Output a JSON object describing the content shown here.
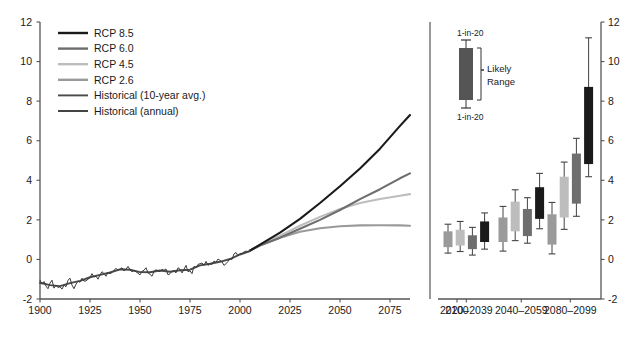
{
  "figure": {
    "title": "",
    "panels": [
      "projection-timeseries",
      "scenario-box-plots"
    ]
  },
  "colors": {
    "rcp85": "#1a1a1a",
    "rcp60": "#6e6e6e",
    "rcp45": "#bdbdbd",
    "rcp26": "#9a9a9a",
    "historical_10yr": "#4a4a4a",
    "historical_annual": "#3a3a3a",
    "axis": "#555555",
    "text": "#1a1a1a",
    "inset_box": "#555555"
  },
  "left_panel": {
    "y_ticks": [
      "12",
      "10",
      "8",
      "6",
      "4",
      "2",
      "0",
      "-2"
    ],
    "x_ticks": [
      "1900",
      "1925",
      "1950",
      "1975",
      "2000",
      "2025",
      "2050",
      "2075"
    ],
    "legend": [
      {
        "label": "RCP 8.5",
        "color_key": "rcp85"
      },
      {
        "label": "RCP 6.0",
        "color_key": "rcp60"
      },
      {
        "label": "RCP 4.5",
        "color_key": "rcp45"
      },
      {
        "label": "RCP 2.6",
        "color_key": "rcp26"
      },
      {
        "label": "Historical (10-year avg.)",
        "color_key": "historical_10yr"
      },
      {
        "label": "Historical (annual)",
        "color_key": "historical_annual"
      }
    ]
  },
  "right_panel": {
    "y_ticks": [
      "12",
      "10",
      "8",
      "6",
      "4",
      "2",
      "0",
      "-2"
    ],
    "x_ticks": [
      "2100",
      "2020–2039",
      "2040–2059",
      "2080–2099"
    ],
    "inset": {
      "upper_label": "1-in-20",
      "lower_label": "1-in-20",
      "bracket_label_line1": "Likely",
      "bracket_label_line2": "Range"
    }
  },
  "chart_data": {
    "type": "line",
    "title": "",
    "xlabel": "",
    "ylabel": "",
    "xlim": [
      1900,
      2085
    ],
    "ylim": [
      -2,
      12
    ],
    "grid": false,
    "legend_position": "upper-left",
    "x_ticks": [
      1900,
      1925,
      1950,
      1975,
      2000,
      2025,
      2050,
      2075
    ],
    "y_ticks": [
      -2,
      0,
      2,
      4,
      6,
      8,
      10,
      12
    ],
    "series": [
      {
        "name": "Historical (annual)",
        "color_key": "historical_annual",
        "x": [
          1900,
          1901,
          1902,
          1903,
          1904,
          1905,
          1906,
          1907,
          1908,
          1909,
          1910,
          1911,
          1912,
          1913,
          1914,
          1915,
          1916,
          1917,
          1918,
          1919,
          1920,
          1921,
          1922,
          1923,
          1924,
          1925,
          1926,
          1927,
          1928,
          1929,
          1930,
          1931,
          1932,
          1933,
          1934,
          1935,
          1936,
          1937,
          1938,
          1939,
          1940,
          1941,
          1942,
          1943,
          1944,
          1945,
          1946,
          1947,
          1948,
          1949,
          1950,
          1951,
          1952,
          1953,
          1954,
          1955,
          1956,
          1957,
          1958,
          1959,
          1960,
          1961,
          1962,
          1963,
          1964,
          1965,
          1966,
          1967,
          1968,
          1969,
          1970,
          1971,
          1972,
          1973,
          1974,
          1975,
          1976,
          1977,
          1978,
          1979,
          1980,
          1981,
          1982,
          1983,
          1984,
          1985,
          1986,
          1987,
          1988,
          1989,
          1990,
          1991,
          1992,
          1993,
          1994,
          1995,
          1996,
          1997,
          1998,
          1999,
          2000,
          2001,
          2002,
          2003,
          2004,
          2005
        ],
        "values": [
          -1.05,
          -1.25,
          -1.12,
          -1.35,
          -1.48,
          -1.2,
          -1.05,
          -1.45,
          -1.3,
          -1.42,
          -1.38,
          -1.5,
          -1.3,
          -1.38,
          -1.05,
          -0.95,
          -1.3,
          -1.48,
          -1.25,
          -1.1,
          -1.15,
          -0.95,
          -1.1,
          -1.08,
          -1.0,
          -0.92,
          -0.72,
          -0.88,
          -0.85,
          -1.0,
          -0.78,
          -0.62,
          -0.72,
          -0.85,
          -0.65,
          -0.72,
          -0.66,
          -0.55,
          -0.45,
          -0.55,
          -0.5,
          -0.42,
          -0.58,
          -0.5,
          -0.35,
          -0.52,
          -0.62,
          -0.55,
          -0.62,
          -0.7,
          -0.78,
          -0.6,
          -0.55,
          -0.42,
          -0.68,
          -0.75,
          -0.85,
          -0.6,
          -0.52,
          -0.58,
          -0.62,
          -0.5,
          -0.55,
          -0.48,
          -0.78,
          -0.72,
          -0.6,
          -0.58,
          -0.68,
          -0.42,
          -0.5,
          -0.68,
          -0.5,
          -0.3,
          -0.62,
          -0.58,
          -0.72,
          -0.35,
          -0.42,
          -0.25,
          -0.22,
          -0.18,
          -0.3,
          -0.1,
          -0.3,
          -0.22,
          -0.25,
          -0.08,
          -0.15,
          0.02,
          -0.05,
          -0.12,
          -0.3,
          -0.22,
          -0.1,
          0.05,
          0.0,
          0.28,
          0.35,
          0.18,
          0.3,
          0.3,
          0.38,
          0.42,
          0.4,
          0.45
        ]
      },
      {
        "name": "Historical (10-year avg.)",
        "color_key": "historical_10yr",
        "x": [
          1900,
          1905,
          1910,
          1915,
          1920,
          1925,
          1930,
          1935,
          1940,
          1945,
          1950,
          1955,
          1960,
          1965,
          1970,
          1975,
          1980,
          1985,
          1990,
          1995,
          2000,
          2005
        ],
        "values": [
          -1.18,
          -1.3,
          -1.35,
          -1.2,
          -1.08,
          -0.9,
          -0.78,
          -0.66,
          -0.5,
          -0.52,
          -0.64,
          -0.65,
          -0.56,
          -0.62,
          -0.55,
          -0.52,
          -0.3,
          -0.22,
          -0.12,
          0.02,
          0.25,
          0.42
        ]
      },
      {
        "name": "RCP 8.5",
        "color_key": "rcp85",
        "x": [
          2005,
          2010,
          2020,
          2030,
          2040,
          2050,
          2060,
          2070,
          2080,
          2085
        ],
        "values": [
          0.45,
          0.75,
          1.35,
          2.05,
          2.85,
          3.7,
          4.6,
          5.6,
          6.75,
          7.3
        ]
      },
      {
        "name": "RCP 6.0",
        "color_key": "rcp60",
        "x": [
          2005,
          2010,
          2020,
          2030,
          2040,
          2050,
          2060,
          2070,
          2080,
          2085
        ],
        "values": [
          0.45,
          0.7,
          1.1,
          1.55,
          2.0,
          2.5,
          3.05,
          3.55,
          4.1,
          4.35
        ]
      },
      {
        "name": "RCP 4.5",
        "color_key": "rcp45",
        "x": [
          2005,
          2010,
          2020,
          2030,
          2040,
          2050,
          2060,
          2070,
          2080,
          2085
        ],
        "values": [
          0.45,
          0.72,
          1.2,
          1.7,
          2.15,
          2.55,
          2.85,
          3.05,
          3.22,
          3.3
        ]
      },
      {
        "name": "RCP 2.6",
        "color_key": "rcp26",
        "x": [
          2005,
          2010,
          2020,
          2030,
          2040,
          2050,
          2060,
          2070,
          2080,
          2085
        ],
        "values": [
          0.45,
          0.72,
          1.1,
          1.4,
          1.58,
          1.68,
          1.72,
          1.73,
          1.72,
          1.7
        ]
      }
    ],
    "box_plots": {
      "type": "box",
      "ylim": [
        -2,
        12
      ],
      "groups": [
        {
          "label": "2020–2039",
          "boxes": [
            {
              "scenario": "RCP 2.6",
              "color_key": "rcp26",
              "low": 0.62,
              "high": 1.42,
              "whisker_low": 0.32,
              "whisker_high": 1.78
            },
            {
              "scenario": "RCP 4.5",
              "color_key": "rcp45",
              "low": 0.7,
              "high": 1.5,
              "whisker_low": 0.4,
              "whisker_high": 1.92
            },
            {
              "scenario": "RCP 6.0",
              "color_key": "rcp60",
              "low": 0.52,
              "high": 1.22,
              "whisker_low": 0.22,
              "whisker_high": 1.62
            },
            {
              "scenario": "RCP 8.5",
              "color_key": "rcp85",
              "low": 0.88,
              "high": 1.92,
              "whisker_low": 0.52,
              "whisker_high": 2.35
            }
          ]
        },
        {
          "label": "2040–2059",
          "boxes": [
            {
              "scenario": "RCP 2.6",
              "color_key": "rcp26",
              "low": 0.88,
              "high": 2.12,
              "whisker_low": 0.42,
              "whisker_high": 2.68
            },
            {
              "scenario": "RCP 4.5",
              "color_key": "rcp45",
              "low": 1.42,
              "high": 2.92,
              "whisker_low": 0.95,
              "whisker_high": 3.52
            },
            {
              "scenario": "RCP 6.0",
              "color_key": "rcp60",
              "low": 1.18,
              "high": 2.55,
              "whisker_low": 0.82,
              "whisker_high": 3.12
            },
            {
              "scenario": "RCP 8.5",
              "color_key": "rcp85",
              "low": 2.05,
              "high": 3.65,
              "whisker_low": 1.55,
              "whisker_high": 4.35
            }
          ]
        },
        {
          "label": "2080–2099",
          "boxes": [
            {
              "scenario": "RCP 2.6",
              "color_key": "rcp26",
              "low": 0.75,
              "high": 2.28,
              "whisker_low": 0.28,
              "whisker_high": 2.88
            },
            {
              "scenario": "RCP 4.5",
              "color_key": "rcp45",
              "low": 2.12,
              "high": 4.18,
              "whisker_low": 1.52,
              "whisker_high": 4.92
            },
            {
              "scenario": "RCP 6.0",
              "color_key": "rcp60",
              "low": 2.82,
              "high": 5.35,
              "whisker_low": 2.18,
              "whisker_high": 6.12
            },
            {
              "scenario": "RCP 8.5",
              "color_key": "rcp85",
              "low": 4.82,
              "high": 8.72,
              "whisker_low": 4.18,
              "whisker_high": 11.2
            }
          ]
        }
      ]
    }
  }
}
